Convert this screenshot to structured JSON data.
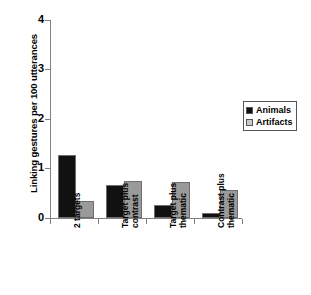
{
  "chart_data": {
    "type": "bar",
    "title": "",
    "xlabel": "",
    "ylabel": "Linking gestures per 100 utterances",
    "ylim": [
      0,
      4
    ],
    "yticks": [
      "0",
      "1",
      "2",
      "3",
      "4"
    ],
    "grid": false,
    "legend_position": "right",
    "categories": [
      "2 targets",
      "Target plus\ncontrast",
      "Target plus\nthematic",
      "Contrast plus\nthematic"
    ],
    "series": [
      {
        "name": "Animals",
        "color": "#111111",
        "values": [
          1.28,
          0.67,
          0.26,
          0.1
        ]
      },
      {
        "name": "Artifacts",
        "color": "#9a9a9a",
        "values": [
          0.34,
          0.75,
          0.72,
          0.56
        ]
      }
    ]
  },
  "legend": {
    "entries": [
      {
        "label": "Animals"
      },
      {
        "label": "Artifacts"
      }
    ]
  },
  "axis": {
    "y_title": "Linking gestures per 100 utterances",
    "y_tick_0": "0",
    "y_tick_1": "1",
    "y_tick_2": "2",
    "y_tick_3": "3",
    "y_tick_4": "4"
  },
  "x_labels": {
    "cat_0": "2 targets",
    "cat_1": "Target plus\ncontrast",
    "cat_2": "Target plus\nthematic",
    "cat_3": "Contrast plus\nthematic"
  }
}
